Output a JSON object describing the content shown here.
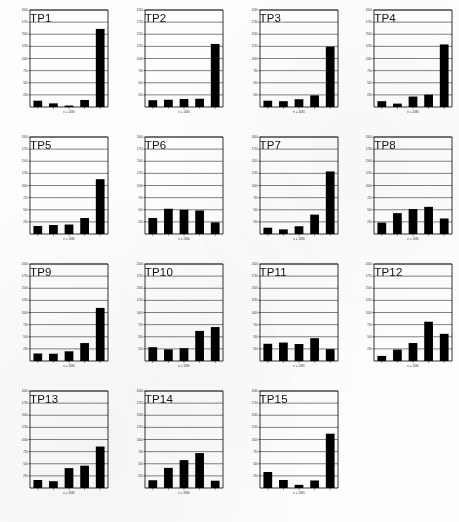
{
  "figure": {
    "kind": "small-multiples-bar-chart-grid",
    "columns": 4,
    "rows": 4,
    "panel_count": 15,
    "background_color": "#ffffff",
    "bar_color": "#000000",
    "axis_color": "#000000",
    "gridline_color": "#1a1a1a"
  },
  "axis": {
    "y_ticks": [
      250,
      500,
      750,
      1000,
      1250,
      1500,
      1750,
      2000
    ],
    "y_min": 0,
    "y_max": 2000,
    "x_caption": "n = 1580",
    "x_tick_count": 5,
    "x_categories": [
      "1",
      "2",
      "3",
      "4",
      "5"
    ]
  },
  "chart_data": [
    {
      "type": "bar",
      "title": "TP1",
      "categories": [
        "1",
        "2",
        "3",
        "4",
        "5"
      ],
      "values": [
        130,
        75,
        30,
        145,
        1610
      ],
      "xlabel": "n = 1580",
      "ylabel": "",
      "ylim": [
        0,
        2000
      ],
      "grid": true
    },
    {
      "type": "bar",
      "title": "TP2",
      "categories": [
        "1",
        "2",
        "3",
        "4",
        "5"
      ],
      "values": [
        140,
        150,
        165,
        170,
        1300
      ],
      "xlabel": "n = 1580",
      "ylabel": "",
      "ylim": [
        0,
        2000
      ],
      "grid": true
    },
    {
      "type": "bar",
      "title": "TP3",
      "categories": [
        "1",
        "2",
        "3",
        "4",
        "5"
      ],
      "values": [
        130,
        120,
        160,
        240,
        1245
      ],
      "xlabel": "n = 1580",
      "ylabel": "",
      "ylim": [
        0,
        2000
      ],
      "grid": true
    },
    {
      "type": "bar",
      "title": "TP4",
      "categories": [
        "1",
        "2",
        "3",
        "4",
        "5"
      ],
      "values": [
        120,
        70,
        215,
        255,
        1290
      ],
      "xlabel": "n = 1580",
      "ylabel": "",
      "ylim": [
        0,
        2000
      ],
      "grid": true
    },
    {
      "type": "bar",
      "title": "TP5",
      "categories": [
        "1",
        "2",
        "3",
        "4",
        "5"
      ],
      "values": [
        165,
        185,
        195,
        330,
        1130
      ],
      "xlabel": "n = 1580",
      "ylabel": "",
      "ylim": [
        0,
        2000
      ],
      "grid": true
    },
    {
      "type": "bar",
      "title": "TP6",
      "categories": [
        "1",
        "2",
        "3",
        "4",
        "5"
      ],
      "values": [
        330,
        520,
        500,
        485,
        240
      ],
      "xlabel": "n = 1580",
      "ylabel": "",
      "ylim": [
        0,
        2000
      ],
      "grid": true
    },
    {
      "type": "bar",
      "title": "TP7",
      "categories": [
        "1",
        "2",
        "3",
        "4",
        "5"
      ],
      "values": [
        130,
        95,
        160,
        400,
        1290
      ],
      "xlabel": "n = 1580",
      "ylabel": "",
      "ylim": [
        0,
        2000
      ],
      "grid": true
    },
    {
      "type": "bar",
      "title": "TP8",
      "categories": [
        "1",
        "2",
        "3",
        "4",
        "5"
      ],
      "values": [
        235,
        430,
        515,
        560,
        320
      ],
      "xlabel": "n = 1580",
      "ylabel": "",
      "ylim": [
        0,
        2000
      ],
      "grid": true
    },
    {
      "type": "bar",
      "title": "TP9",
      "categories": [
        "1",
        "2",
        "3",
        "4",
        "5"
      ],
      "values": [
        155,
        150,
        200,
        370,
        1095
      ],
      "xlabel": "n = 1580",
      "ylabel": "",
      "ylim": [
        0,
        2000
      ],
      "grid": true
    },
    {
      "type": "bar",
      "title": "TP10",
      "categories": [
        "1",
        "2",
        "3",
        "4",
        "5"
      ],
      "values": [
        285,
        240,
        265,
        620,
        700
      ],
      "xlabel": "n = 1580",
      "ylabel": "",
      "ylim": [
        0,
        2000
      ],
      "grid": true
    },
    {
      "type": "bar",
      "title": "TP11",
      "categories": [
        "1",
        "2",
        "3",
        "4",
        "5"
      ],
      "values": [
        355,
        380,
        350,
        470,
        245
      ],
      "xlabel": "n = 1580",
      "ylabel": "",
      "ylim": [
        0,
        2000
      ],
      "grid": true
    },
    {
      "type": "bar",
      "title": "TP12",
      "categories": [
        "1",
        "2",
        "3",
        "4",
        "5"
      ],
      "values": [
        105,
        235,
        370,
        810,
        560
      ],
      "xlabel": "n = 1580",
      "ylabel": "",
      "ylim": [
        0,
        2000
      ],
      "grid": true
    },
    {
      "type": "bar",
      "title": "TP13",
      "categories": [
        "1",
        "2",
        "3",
        "4",
        "5"
      ],
      "values": [
        165,
        140,
        410,
        460,
        855
      ],
      "xlabel": "n = 1580",
      "ylabel": "",
      "ylim": [
        0,
        2000
      ],
      "grid": true
    },
    {
      "type": "bar",
      "title": "TP14",
      "categories": [
        "1",
        "2",
        "3",
        "4",
        "5"
      ],
      "values": [
        160,
        415,
        575,
        720,
        150
      ],
      "xlabel": "n = 1580",
      "ylabel": "",
      "ylim": [
        0,
        2000
      ],
      "grid": true
    },
    {
      "type": "bar",
      "title": "TP15",
      "categories": [
        "1",
        "2",
        "3",
        "4",
        "5"
      ],
      "values": [
        330,
        165,
        65,
        155,
        1120
      ],
      "xlabel": "n = 1580",
      "ylabel": "",
      "ylim": [
        0,
        2000
      ],
      "grid": true
    }
  ]
}
